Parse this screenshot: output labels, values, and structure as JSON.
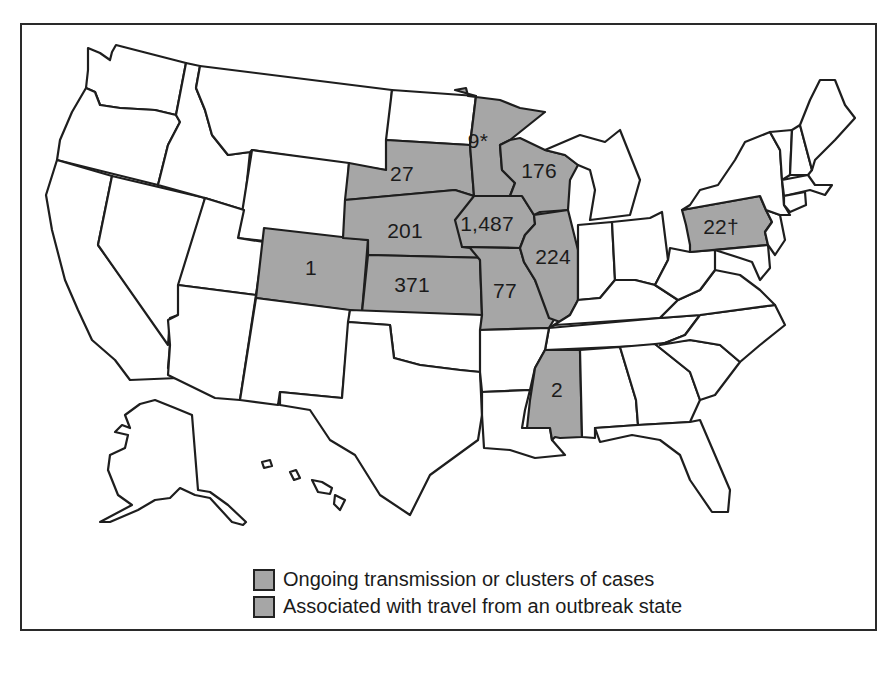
{
  "map": {
    "title": "",
    "region": "United States",
    "highlight_color": "#a6a6a6",
    "border_color": "#1e1e1e",
    "states": [
      {
        "state": "Colorado",
        "label": "1",
        "highlighted": true
      },
      {
        "state": "South Dakota",
        "label": "27",
        "highlighted": true
      },
      {
        "state": "Nebraska",
        "label": "201",
        "highlighted": true
      },
      {
        "state": "Kansas",
        "label": "371",
        "highlighted": true
      },
      {
        "state": "Minnesota",
        "label": "9*",
        "highlighted": true
      },
      {
        "state": "Iowa",
        "label": "1,487",
        "highlighted": true
      },
      {
        "state": "Missouri",
        "label": "77",
        "highlighted": true
      },
      {
        "state": "Wisconsin",
        "label": "176",
        "highlighted": true
      },
      {
        "state": "Illinois",
        "label": "224",
        "highlighted": true
      },
      {
        "state": "Mississippi",
        "label": "2",
        "highlighted": true
      },
      {
        "state": "Pennsylvania",
        "label": "22†",
        "highlighted": true
      }
    ]
  },
  "legend": {
    "items": [
      {
        "label": "Ongoing transmission or clusters of cases",
        "color": "#a6a6a6"
      },
      {
        "label": "Associated with travel from an outbreak state",
        "color": "#a6a6a6"
      }
    ]
  }
}
